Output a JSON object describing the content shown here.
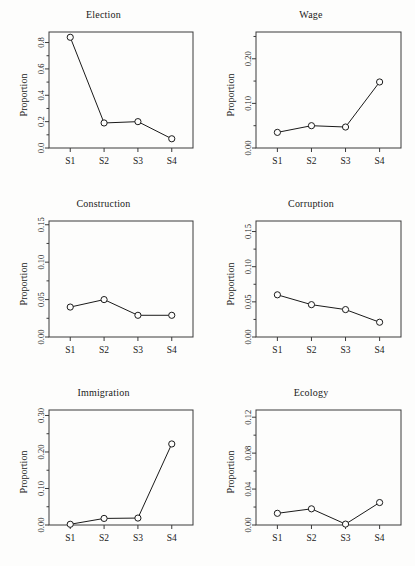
{
  "figure": {
    "ylabel": "Proportion",
    "xlabel": "",
    "categories": [
      "S1",
      "S2",
      "S3",
      "S4"
    ],
    "layout": {
      "rows": 3,
      "cols": 2
    },
    "marker": "open-circle",
    "line_color": "#1a1a1a",
    "background": "#fdfdfc",
    "grid": false
  },
  "chart_data": [
    {
      "type": "line",
      "title": "Election",
      "xlabel": "",
      "ylabel": "Proportion",
      "categories": [
        "S1",
        "S2",
        "S3",
        "S4"
      ],
      "values": [
        0.84,
        0.19,
        0.2,
        0.07
      ],
      "ylim": [
        0.0,
        0.88
      ],
      "yticks": [
        0.0,
        0.2,
        0.4,
        0.6,
        0.8
      ],
      "ytick_labels": [
        "0.0",
        "0.2",
        "0.4",
        "0.6",
        "0.8"
      ],
      "yminor": [
        0.1,
        0.3,
        0.5,
        0.7
      ],
      "grid": false,
      "legend": null
    },
    {
      "type": "line",
      "title": "Wage",
      "xlabel": "",
      "ylabel": "Proportion",
      "categories": [
        "S1",
        "S2",
        "S3",
        "S4"
      ],
      "values": [
        0.035,
        0.05,
        0.047,
        0.148
      ],
      "ylim": [
        0.0,
        0.26
      ],
      "yticks": [
        0.0,
        0.1,
        0.2
      ],
      "ytick_labels": [
        "0.00",
        "0.10",
        "0.20"
      ],
      "yminor": [
        0.05,
        0.15,
        0.25
      ],
      "grid": false,
      "legend": null
    },
    {
      "type": "line",
      "title": "Construction",
      "xlabel": "",
      "ylabel": "Proportion",
      "categories": [
        "S1",
        "S2",
        "S3",
        "S4"
      ],
      "values": [
        0.04,
        0.05,
        0.029,
        0.029
      ],
      "ylim": [
        0.0,
        0.155
      ],
      "yticks": [
        0.0,
        0.05,
        0.1,
        0.15
      ],
      "ytick_labels": [
        "0.00",
        "0.05",
        "0.10",
        "0.15"
      ],
      "yminor": [
        0.025,
        0.075,
        0.125
      ],
      "grid": false,
      "legend": null
    },
    {
      "type": "line",
      "title": "Corruption",
      "xlabel": "",
      "ylabel": "Proportion",
      "categories": [
        "S1",
        "S2",
        "S3",
        "S4"
      ],
      "values": [
        0.06,
        0.046,
        0.039,
        0.021
      ],
      "ylim": [
        0.0,
        0.165
      ],
      "yticks": [
        0.0,
        0.05,
        0.1,
        0.15
      ],
      "ytick_labels": [
        "0.00",
        "0.05",
        "0.10",
        "0.15"
      ],
      "yminor": [
        0.025,
        0.075,
        0.125
      ],
      "grid": false,
      "legend": null
    },
    {
      "type": "line",
      "title": "Immigration",
      "xlabel": "",
      "ylabel": "Proportion",
      "categories": [
        "S1",
        "S2",
        "S3",
        "S4"
      ],
      "values": [
        0.002,
        0.018,
        0.019,
        0.222
      ],
      "ylim": [
        0.0,
        0.315
      ],
      "yticks": [
        0.0,
        0.1,
        0.2,
        0.3
      ],
      "ytick_labels": [
        "0.00",
        "0.10",
        "0.20",
        "0.30"
      ],
      "yminor": [
        0.05,
        0.15,
        0.25
      ],
      "grid": false,
      "legend": null
    },
    {
      "type": "line",
      "title": "Ecology",
      "xlabel": "",
      "ylabel": "Proportion",
      "categories": [
        "S1",
        "S2",
        "S3",
        "S4"
      ],
      "values": [
        0.013,
        0.018,
        0.001,
        0.025
      ],
      "ylim": [
        0.0,
        0.128
      ],
      "yticks": [
        0.0,
        0.04,
        0.08,
        0.12
      ],
      "ytick_labels": [
        "0.00",
        "0.04",
        "0.08",
        "0.12"
      ],
      "yminor": [
        0.02,
        0.06,
        0.1
      ],
      "grid": false,
      "legend": null
    }
  ]
}
